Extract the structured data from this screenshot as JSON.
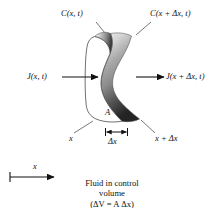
{
  "figure": {
    "name": "fluid-control-volume-diagram",
    "type": "scientific-diagram",
    "background_color": "#ffffff",
    "ink_color": "#111111",
    "labels": {
      "concentration_left": "C(x, t)",
      "concentration_right": "C(x + Δx, t)",
      "flux_left": "J(x, t)",
      "flux_right": "J(x + Δx, t)",
      "area": "A",
      "position_left": "x",
      "position_right": "x + Δx",
      "thickness": "Δx",
      "axis_label": "x"
    },
    "caption": {
      "line1": "Fluid in control",
      "line2": "volume",
      "line3": "(ΔV = A Δx)"
    },
    "shading": {
      "face_fill": "#ffffff",
      "side_light": "#e8e8e8",
      "side_mid": "#9a9a9a",
      "side_dark": "#2e2e2e",
      "outline": "#3c3c3c"
    }
  }
}
